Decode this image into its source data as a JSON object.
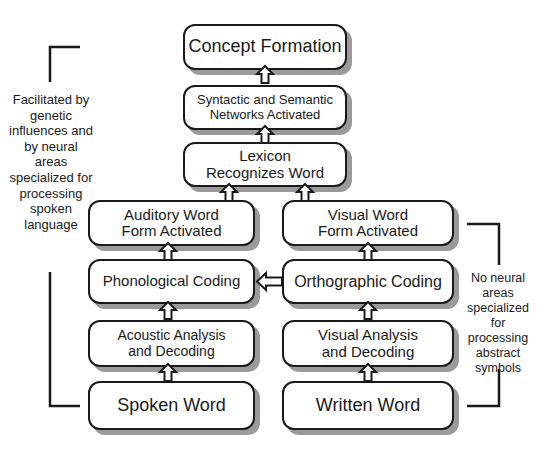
{
  "diagram": {
    "type": "flowchart",
    "direction": "bottom-to-top",
    "boxes": {
      "concept_formation": "Concept Formation",
      "syntactic_semantic": "Syntactic and Semantic Networks Activated",
      "lexicon": "Lexicon Recognizes Word",
      "auditory_word_form": "Auditory Word Form Activated",
      "visual_word_form": "Visual Word Form Activated",
      "phonological_coding": "Phonological Coding",
      "orthographic_coding": "Orthographic Coding",
      "acoustic_analysis": "Acoustic Analysis and Decoding",
      "visual_analysis": "Visual Analysis and Decoding",
      "spoken_word": "Spoken Word",
      "written_word": "Written Word"
    },
    "notes": {
      "left": "Facilitated by genetic influences and by neural areas specialized for processing spoken language",
      "right": "No neural areas specialized for processing abstract symbols"
    },
    "colors": {
      "border": "#1a1a1a",
      "shadow": "#9a9a9a",
      "fill": "#ffffff"
    }
  }
}
